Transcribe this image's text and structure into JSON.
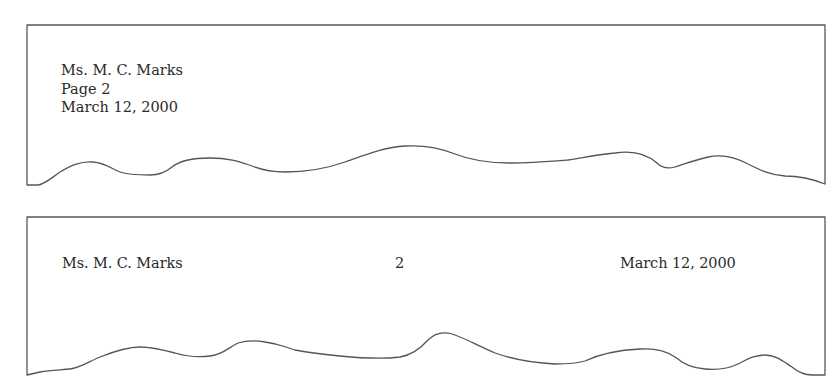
{
  "example_block_style": {
    "label": "Vertical heading format",
    "lines": [
      "Ms. M. C. Marks",
      "Page 2",
      "March 12, 2000"
    ]
  },
  "example_horizontal_style": {
    "label": "Horizontal heading format",
    "recipient": "Ms. M. C. Marks",
    "page_number": "2",
    "date": "March 12, 2000"
  },
  "colors": {
    "outline": "#555555",
    "text": "#2a2a2a",
    "background": "#ffffff"
  }
}
